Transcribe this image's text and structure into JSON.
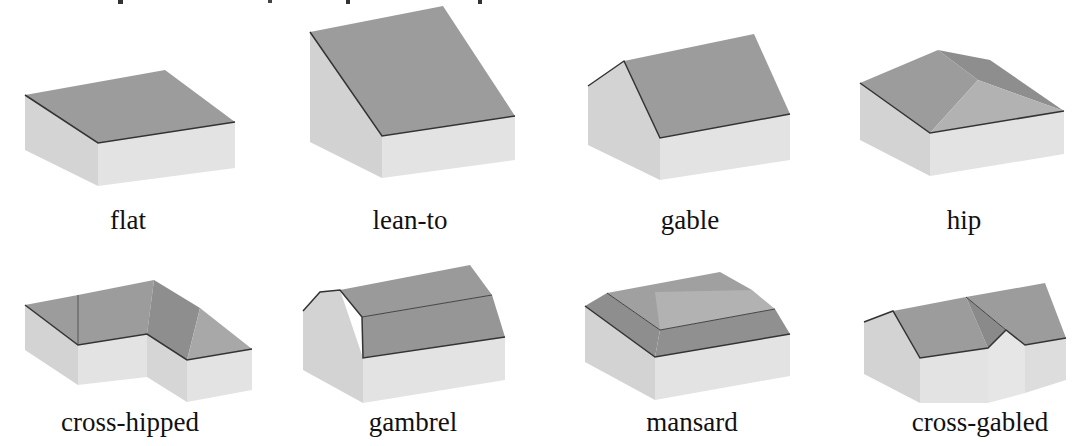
{
  "figure": {
    "type": "roof-types-illustration",
    "colors": {
      "roof": "#9c9c9c",
      "roof_dark": "#8a8a8a",
      "roof_light": "#b0b0b0",
      "wall_left": "#d4d4d4",
      "wall_front": "#e2e2e2",
      "edge": "#333333",
      "background": "#ffffff"
    },
    "rows": [
      {
        "items": [
          {
            "label": "flat"
          },
          {
            "label": "lean-to"
          },
          {
            "label": "gable"
          },
          {
            "label": "hip"
          }
        ]
      },
      {
        "items": [
          {
            "label": "cross-hipped"
          },
          {
            "label": "gambrel"
          },
          {
            "label": "mansard"
          },
          {
            "label": "cross-gabled"
          }
        ]
      }
    ]
  }
}
